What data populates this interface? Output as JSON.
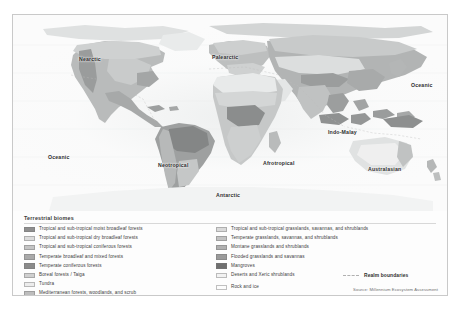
{
  "figure": {
    "type": "thematic-world-map",
    "projection": "equal-area world",
    "source_note": "Source: Millennium Ecosystem Assessment"
  },
  "map": {
    "realm_labels": [
      {
        "name": "Nearctic",
        "x": 66,
        "y": 42,
        "label": "Nearctic"
      },
      {
        "name": "Palearctic",
        "x": 199,
        "y": 40,
        "label": "Palearctic"
      },
      {
        "name": "Oceanic-east",
        "x": 398,
        "y": 68,
        "label": "Oceanic"
      },
      {
        "name": "Indo-Malay",
        "x": 315,
        "y": 115,
        "label": "Indo-Malay"
      },
      {
        "name": "Oceanic-west",
        "x": 35,
        "y": 140,
        "label": "Oceanic"
      },
      {
        "name": "Neotropical",
        "x": 145,
        "y": 148,
        "label": "Neotropical"
      },
      {
        "name": "Afrotropical",
        "x": 250,
        "y": 146,
        "label": "Afrotropical"
      },
      {
        "name": "Australasian",
        "x": 355,
        "y": 152,
        "label": "Australasian"
      },
      {
        "name": "Antarctic",
        "x": 203,
        "y": 178,
        "label": "Antarctic"
      }
    ]
  },
  "legend": {
    "title": "Terrestrial biomes",
    "left_column": [
      {
        "label": "Tropical and sub-tropical moist broadleaf forests",
        "color": "#8f8f8f"
      },
      {
        "label": "Tropical and sub-tropical dry broadleaf forests",
        "color": "#dcdcdc"
      },
      {
        "label": "Tropical and sub-tropical coniferous forests",
        "color": "#c4c4c4"
      },
      {
        "label": "Temperate broadleaf and mixed forests",
        "color": "#a9a9a9"
      },
      {
        "label": "Temperate coniferous forests",
        "color": "#8a8a8a"
      },
      {
        "label": "Boreal forests / Taiga",
        "color": "#cfcfcf"
      },
      {
        "label": "Tundra",
        "color": "#ececec"
      },
      {
        "label": "Mediterranean forests, woodlands, and scrub",
        "color": "#bdbdbd"
      }
    ],
    "right_column": [
      {
        "label": "Tropical and sub-tropical grasslands, savannas, and shrublands",
        "color": "#dadada"
      },
      {
        "label": "Temperate grasslands, savannas, and shrublands",
        "color": "#c2c2c2"
      },
      {
        "label": "Montane grasslands and shrublands",
        "color": "#b0b0b0"
      },
      {
        "label": "Flooded grasslands and savannas",
        "color": "#9a9a9a"
      },
      {
        "label": "Mangroves",
        "color": "#6f6f6f"
      },
      {
        "label": "Deserts and Xeric shrublands",
        "color": "#f2f2f2"
      }
    ],
    "rock_and_ice": {
      "label": "Rock and ice",
      "color": "#fcfcfc"
    },
    "realm_boundaries": {
      "label": "Realm boundaries",
      "color": "#b0b0b0"
    }
  }
}
